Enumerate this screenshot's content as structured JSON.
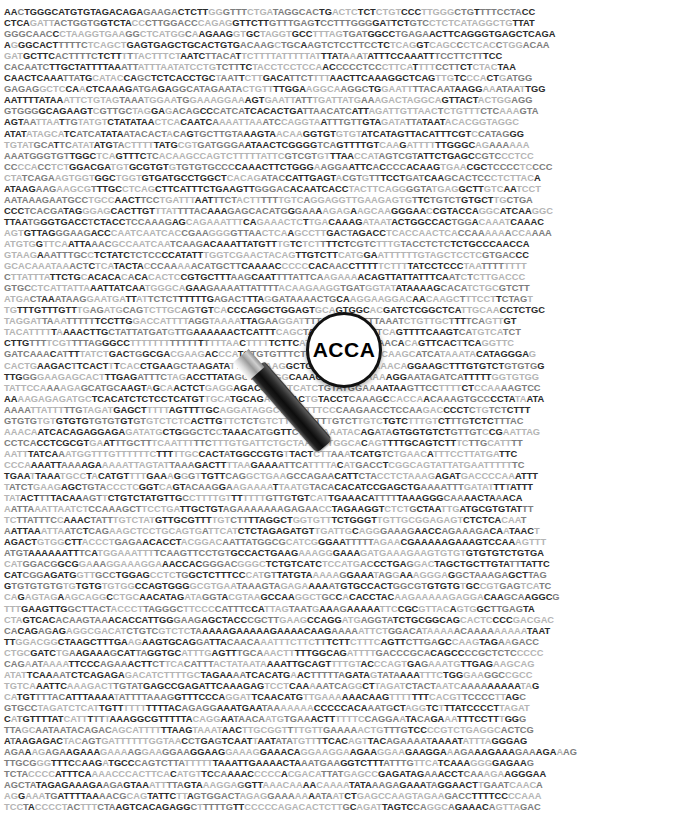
{
  "image": {
    "title": "DNA sequence with magnifying glass",
    "width": 682,
    "height": 819,
    "background_color": "#ffffff"
  },
  "sequence_field": {
    "name": "dna-sequence-block",
    "characters_per_line": 81,
    "line_count": 72,
    "alphabet": "ACGT",
    "text_colors": {
      "dark": "#2b2b2b",
      "mid": "#7d7d7d",
      "light": "#b4b4b4"
    },
    "lines": [
      "AACTGGGCATGTGTAGACAGAGAAGACTCTTGGGTTTCTGATAGGCACTGACTCTCTCTGTCCCTTGGGCTGTTTTCCTACC",
      "CTCAGATTACTGGTGGTCTACCCTTGGACCCAGAGGTTCTTGTTTGAGTCCTTTGGGGATTCTGTCCTCTCATAGGCTGTTAT",
      "GGGCAACCCTAAGGTGAAGGCTCATGGCAAGAAGGTGCTAGGTGCCTTTAGTGATGGCCTGAGAACTTCAGGGTGAGCTCAGA",
      "AGGGCACTTTTTCTCAGCTGAGTGAGCTGCACTGTGACAAGCTGCAAGTCTCCTTCCTCTCAGGTCAGCCCTCACCTGGACAA",
      "GATGCTTCACTTTTCTCTTTTTACTTTCTAATCTTACATTCTTTTATTTTTATTTATAAATATTTCCAAATTTCCTTCTTTCC",
      "CACAATCTTGCTATTTTAAATTATTTAATATCCTGTCTTTCTACCTCCTCCAACCCCCTCCCTTCATTTTCCTTCTCTACTAA",
      "CAACTCAAATTATGCATACCAGCTCTCACCTGCTAATTCTTGACATTCTTTTAACTTCAAAGGCTCAGTTGTCCCACTGATGG",
      "GAGAGGCTCCAACTCAAAGATGAGAGGCATAGAATACTGTTTTGGAAGGCAAGGCTGGAATTTTACAATAAGGAAATAATTGG",
      "AATTTTATAAATTCTGTAGTAAATGGAATGGAAAGGAAAGTGAATTATTTGATTATGAAAGACTAGGCAGTTACTACTGGAGG",
      "GTGGGGCAGAAGTCGTTGCTAGGAGACAGCCCATCATCACACTGATTAACATCATTAGATTGTTAACTCTGTTTCTCAAAGTA",
      "AGTAATTAATTGTATGTCTATATAACTCACAATCAAAATTAAATCCAGGTAATTTGTTGTAGATATTATAATACACGGTAGGC",
      "ATATATAGCATCATCATATAATACACTACAGTGCTTGTAAAGTAACAAGGTGTGTGTATCATAGTTACATTTCGTCCATAGGG",
      "TGTATGCATTCATATATGTACTTTTTATGCGTGATGGGAATAACTCGGGGTCAGTTTTGTCAAGATTTTTTGGGCAGAAAAAA",
      "AAATGGGTGTTGGCTCAGTTTCTCACAAGCCAGTCTTTTTATTCGTCGTGTTTAACCATAGTCGTATTCTGAGCCGTCCCTCC",
      "CCCCACCTCTGGACGATGTGCGTGTGTGTGTGCCCCAAACTTCTGGGAAGGAATTCACCCCACAAGTGAACGCTCCCCTCCCC",
      "CTATCAGAAGTGGTGGCTGGTGTGATGCCTGGCTCACAGATACCATTGAGTACGTGTTTCCTGATCAAGCACTCCCTCTTACA",
      "ATAAGAAGAAGCGTTTGCCTCAGCTTCATTTCTGAAGTTGGGACACAATCACCTACTTCAGGGGTATGAGGCTTGTCAATCCT",
      "AATAAAGAATGCCTGCCAACTTCCTGATTTAATTTCTACTTTTTTGTCAGGAGGTTGAAGAGTGTTCTGTCTGTGCTTGCTGA",
      "CCCTCACGATAGGGAGCACTTGTTTATTTTACAAAGAGCACATGGGAAAAGAGAAGCAAGGGAACCGTACCAGGCATCAAGGC",
      "TTAATGGGTGACCTCTACCTCCAAAGAGCAGAAATTTCAGAAACTCTTGACAAAGATAATACTGGCCACTGGACAAATCAAAC",
      "AGTGTTAGGGAAGACCCAATCAATCACCGAAGGGGTTAACTCAAGCCTTGACTAGACCTCACCAACTCACCAAAAAACCAAAA",
      "ATGTGGTTCAATTAAACGCCAATCAATCAAGACAAATTATGTTTGTCTCTTTTCTCGTCTTTGTACCTCTCTCTGCCCAACCA",
      "GTAAGAAATTTGCCTCTATCTCTCCCCATATTTGGTCGAACTACAGTTGTCTTCATGGAATTTTTTGTAGCTCCTCGTGACCC",
      "GCACAAATAAACTCTCATACTACCCAAAAACATGCTTCAAAACCCCCCACAACCTTTTTCTTTTATCCTCCCTAATTTTTTTT",
      "CTTATTTATTCTGCACACACACACACTCCGTGCTTTAAGCAATTTTATTCAAGAAAACAGTTATTATTTCAATCTCTTGACCC",
      "GTGCCTCATTATTAAATTATCAATGGGCAGAAGAAAATTATTTTACAAGAAGGTGATGGTATATAAAAGCACATCTGCGTCTT",
      "ATGACTAAATAAGGAATGATTATTCTCTTTTTTGAGACTTTAGGATAAAACTGCAAGGAAGGACAACAAGCTTTCCTTCTAGT",
      "TGTTTGTTTGTTTGAGATGCAGTCTTGCAGTGTCACCCAGGCTGGAGTGCAGTGGCACGATCTCGGCTCATTGCAACCTCTGC",
      "TAGGATTAAATTTTTTCCTTGGACCATTTTAGGTAAAATTAGAAGGATTTTATTTCATTTTAAATCTGTTGCTTTTCAGTTGT",
      "TACATTTTTAAAACTTGCTATTATGATGTTGAAAAAACTCATTTCAGCTAAATATACCGTTCAGTTTTCAAGTCATGTCATCT",
      "CTTGTTTTCGTTTTAGGGCCTTTTTTTTTTTTTTTTTAACTTTTTCTTCATACTCGCATTATAACACAGTTCACTTCAGGTTC",
      "GATCAAACATTTTATCTGACTGGCGACGAAGACCCATGTGTGTTTCTGGCTTTCTCTTCCAAGCATCATAAATACATAGGGAG",
      "CACTGAAGACTTCACTTTCACCTGAAGCTAAGATATTTTAAAAGGCTGACAAAGAACAAACAGGAAGCTTTGTGTCTGTGTGG",
      "TTGGGGAAGAGCACTTTGAGATTTCTAGACCTTATAGGTAAAGGCAAACATAGTAAAAAAGGAATAGATCATTTTTGGTGTGG",
      "TATTCCAAAAGAGCATGCAAGTAGCAACTCTGAGGAGACCGCATCATCTGTATGGAAAATAAGTTCCTTTTCTCCAAAAGTCC",
      "AAAAGAGAGATGCTCACATCTCTCCTCATGTTGCATGCAGAGAGACTGTACCTCAAAGCCACCAACAAAGTGCCCCTATAATA",
      "AAAATTATTTTTGTAGATGAGCTTTTTAGTTTTGCAGGATAGGCTGAATTTCCCAAGAACCTCCAAGACCCCTCTGTCTCTTT",
      "GTGTGTGTGTGTGTGTGTGTGTGTCTCTCACTTGTTCTCTGTCTTTGTCTTTGTCTTGTCTGTCTTTGTCTTTGTCTCTTTAC",
      "AAACAATCACAGAGGAGAGATATGCTGGGCTCCTAAACATGGTTCTCCTAAATACAGATAGTGGTGTCTGTTGTCCGAATTAG",
      "CCTCACCTCGCGTGAATTTGCTTTCAATTTTTCTTTGTGATTCTGCTAATTTTGGCACAGTTTTGCAGTCTTTCTTGCATTTT",
      "AATTTATCAAATGGTTTGTTTTTTCTTTTTGCCACTATGGCCGTGTTACTCTTAAATCATGTCTGAACATTTCCTTATGATTC",
      "CCCAAAATTAAAAGAAAAATTAGTATTAAAGACTTTTAAGAAAATTCATTTTACATGACCTCGGCAGTATTATGAATTTTTTC",
      "TGAATTAAATGCCTACATGTTTTGAAAGGGTTGTTCAGGCTGAAGCCAGAACATTCTACCTCTAAAGAGATGACCCCAAATTT",
      "TATCTGAAGAGCTGTACCCTCGGTCAGTACAAGGAAGAAAATTAATGTACACACATCCGAGCTGAAAATTTGATATTTTATTT",
      "TATACTTTTACAAAGTTCTGTCTATGTTGCCTTTTGTTTTTTTGTTGTGTCATTGAAACATTTTTAAAGGGCAAAACTAAACA",
      "AATTAAATTAATCTCCAAAGCTTCCTGATTGCTGTAGAAAAAAAGAGAACCTAGAAGGTCTCTGCTAATTGATGCGTGTATTT",
      "TCTTATTTCCAAACTATTTGTCTATGTTGCGTTTTGTCTTTTAGGCTGGTGTTTCTGGGTTGTTGCGGAGAGTCTCTCACAAT",
      "AATTAAATTAATCTCAGAAGCTCCTGCAGTGATTCATCTCTAGAGATGTTGATTGCAGGGAAAGAACCAGAAAGACAATAACT",
      "AGACTGTGGCTTACCCTGAGAACACCTACGGACAATTATGGCGCATCGGGAATTTTTAGAACGAAAAAGAAAGTCCAAAGTTT",
      "ATGTAAAAAATTTCATGGAAATTTTCAAGTTCCTGTGCCACTGAAGAAAGGGAAAGATGAAAGAAGTGTGTGTGTGTCTGTGA",
      "CATGGACGGCGGAAAGGAAAGGAAACCACGGGACGGGCTCTGTCATCTCCATGACCCTGAGGACTAGCTGCTTGTATTTATTC",
      "CATCGGAGATGGTTGCCTGGAGCCTCTGGCTCTTTCCCATGTTATGTAAAAAGGAAATAGGAAAGGGAGGCTAAAGAGCTTAG",
      "GTGTGTGTGTGTGTGTGTGGCCAGTGGGGCGTGAATAAAGTAGAGAAAAATGTGCCACTGGCGTGTGTGTGCCGTGAGTCATC",
      "CAGAGTAGAAGCAGGCCTGCAACATAGATAGGTACGTAAGCCAAGGCTGCCACACCTACAAGAAAAAGAGGACAAGCAAGGCG",
      "TTTGAAGTTGGCTTACTACCCTTAGGGCTTCCCCATTTCCATTAGTAATGAAAGAAAAATTCCGCGTTACAGTGGCTTGAGTA",
      "CTAGTCACACAAGTAAACACCATTGGGAAGAGCTACCCGCTTGAAGCCAGGATGAGGTATCTGCGGCAGCACTCCCCGACGAC",
      "CACAGAGAGAGGCGACATCTGTCGTCTCTAAAAAGAAAAAGAAAACAAGAAAAATTCTGGACATAAAAACAAAAAAAAATAAT",
      "TTGGACGGCTAAGCTTTGAAGAAGTGCAGGATTACAACAAATTTCTTCTTTCTTCTTTCAGTTCTTGAGCCAAGTAGAAGACC",
      "CTGCGATCTGAAGAAAGCATTAGGTGCATTTGAGTTTGCAAACTTTTTGGCAGATTTTGACCCGCACAGCCCCGCTCTCCCCC",
      "CAGAATAAAATTCCCAGAAACTTCTTCACATTTACTATAATAAAATTGCAGTTTTGTACCCAGTGAGAAATGTTGAGAAGCAG",
      "ATATTCAAAATCTCAGAGAGACATCTTTTGCTAGAAAATCACATGAACTTTTTAGATAGTATAAAATTTCTGGGAAGGCCGCC",
      "TGTCAAATTCAAAGACTTGTATGAGCCGAGATTCAAAGAGTCCTCAAAAATCAGGCTTAGATCTACTAATCAAAAAAAAATAG",
      "CATGTTTTACATTTAAAATATTTTAAAGGTTTCCCAGGATTCAACATGTTGAAAAAACAAGTTTTTTTCACGTTCCCCTTAGC",
      "GTGCCTAGATCTCATTGTTTTTTTTTTACAGAGGAAATGAATAAAAAAACCCCCACAAATGCTAGGTCTTTATCCCCTTAGAT",
      "CATGTTTTATCATTTTTTAAAGGCGTTTTTACAGGAATAACAATGTGAAACTTTTTTCCAGGAATACAGAAATTTCCTTTGGG",
      "TTAGCAATAATACAGACAGCATTTTTTAAGTAAATAACTTGCGGTTTTGTTGAAAAACTGTTTGTCCCCGTCTGAGGCACTCG",
      "ATAAGAGACTACAGTGATTTTTTGGTAACCTGAGTCAATTAATATATGTTTTCACAGTTACAGAAAATAAAATATTTAGGGAG",
      "AGAAAGAGAAGAAAGAAAAGGAAGGAAGGAAGGAAAGGAAACAGGAAGGAAGAAGGAAGAAGGAAAGAAAGAAAGAAAGAAAG",
      "TTGCGGGTTTCCAAGATGCCCAGTCTTATTTTTTAAATTGAAAACTAAATGAAGGTCTTTATTTGTTCATCAAAGGGGAGAAG",
      "TCTACCCCATTTCAAAACCCACTTCACATGTTCCAAAACCCCCACGACATTATGAGCCGAGATAGAAACCTCAAAGAAGGGAA",
      "AGCTATAGAGAAAGAAGAGTAAATTTTAGTAAAGGAGGTTAAACAAAACAAAATATAAAGAGAAATAGGAACTTGAATCAACA",
      "AGGAAATGATTTTAAAACGCAGTATTCTTAGTGGACTAGAGGAAAAAAATAATCTGAGCCAAGTAGAAGACCTTTTCCCCAAA",
      "TCCTACCCCTACTTTCTAAGTCACAGAGGCTTTTTGTTCCCCCAGACACTCTTGCAGATTAGTCCAGGCAGAAACAGTTAGAC"
    ]
  },
  "magnifier": {
    "name": "magnifying-glass",
    "lens_text": "ACCA",
    "lens_center": {
      "x": 345,
      "y": 350
    },
    "lens_radius": 38,
    "rim_color": "#111111",
    "lens_fill": "#ffffff",
    "handle_color": "#141414",
    "ferrule_color": "#c8c8c8",
    "handle_angle_deg": -41
  }
}
